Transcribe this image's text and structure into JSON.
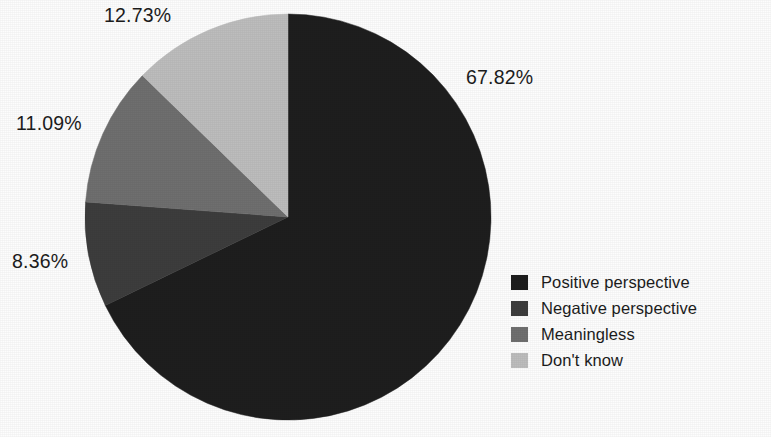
{
  "figure": {
    "background": "#fdfdfd",
    "clipped_title_remnant": "",
    "width": 771,
    "height": 437
  },
  "chart_data": {
    "type": "pie",
    "title": "",
    "xlabel": "",
    "ylabel": "",
    "grid": false,
    "legend_position": "right-bottom",
    "start_angle_deg": 0,
    "direction": "clockwise",
    "categories": [
      "Positive perspective",
      "Negative perspective",
      "Meaningless",
      "Don't know"
    ],
    "values": [
      67.82,
      8.36,
      11.09,
      12.73
    ],
    "labels": [
      "67.82%",
      "8.36%",
      "11.09%",
      "12.73%"
    ],
    "colors": [
      "#1e1e1e",
      "#3d3d3d",
      "#6f6f6f",
      "#bdbdbd"
    ],
    "units": "percent",
    "total": 100.0
  },
  "pie": {
    "center_x": 205,
    "center_y": 205,
    "radius": 203,
    "slices": [
      {
        "name": "Positive perspective",
        "value": 67.82,
        "label": "67.82%",
        "color": "#1e1e1e",
        "start_deg": 0,
        "sweep_deg": 244.152
      },
      {
        "name": "Negative perspective",
        "value": 8.36,
        "label": "8.36%",
        "color": "#3d3d3d",
        "start_deg": 244.152,
        "sweep_deg": 30.096
      },
      {
        "name": "Meaningless",
        "value": 11.09,
        "label": "11.09%",
        "color": "#6f6f6f",
        "start_deg": 274.248,
        "sweep_deg": 39.924
      },
      {
        "name": "Don't know",
        "value": 12.73,
        "label": "12.73%",
        "color": "#bdbdbd",
        "start_deg": 314.172,
        "sweep_deg": 45.828
      }
    ]
  },
  "callouts": {
    "positive": "67.82%",
    "dont_know": "12.73%",
    "meaningless": "11.09%",
    "negative": "8.36%"
  },
  "legend": {
    "items": [
      {
        "label": "Positive perspective",
        "color": "#1e1e1e"
      },
      {
        "label": "Negative perspective",
        "color": "#3d3d3d"
      },
      {
        "label": "Meaningless",
        "color": "#6f6f6f"
      },
      {
        "label": "Don't know",
        "color": "#bdbdbd"
      }
    ]
  }
}
